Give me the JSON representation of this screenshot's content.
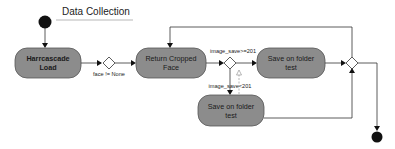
{
  "diagram": {
    "title": "Data Collection",
    "nodes": {
      "harrcascade": {
        "line1": "Harrcascade",
        "line2": "Load"
      },
      "return_cropped": {
        "line1": "Return Cropped",
        "line2": "Face"
      },
      "save_top": {
        "line1": "Save on folder",
        "line2": "test"
      },
      "save_bottom": {
        "line1": "Save on folder",
        "line2": "test"
      }
    },
    "edge_labels": {
      "face_check": "face != None",
      "save_ok": "image_save>=201",
      "save_retry": "image_save<201"
    },
    "colors": {
      "node_fill": "#8c8c8c",
      "start_end": "#111111"
    }
  }
}
